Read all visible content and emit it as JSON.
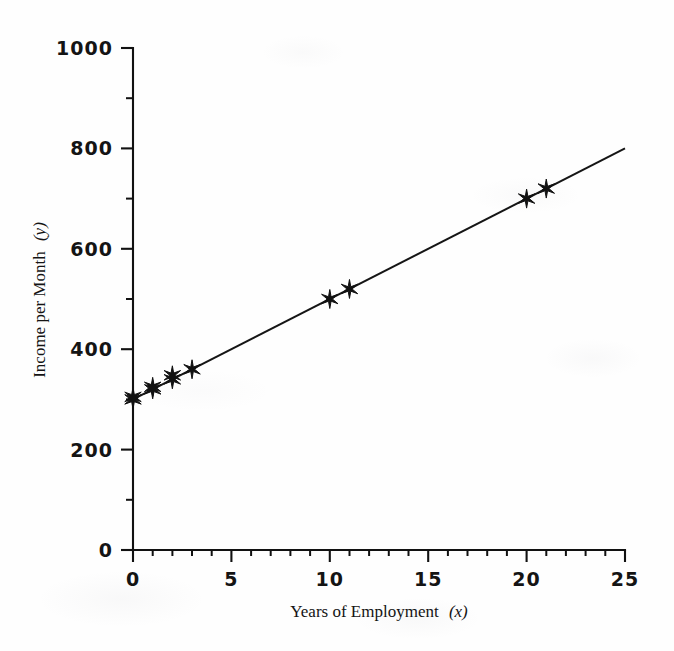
{
  "chart_data": {
    "type": "scatter",
    "title": "",
    "subtitle": "",
    "xlabel": "Years of Employment (x)",
    "xlabel_text": "Years of Employment",
    "xlabel_var": "(x)",
    "ylabel": "Income per Month (y)",
    "ylabel_text": "Income per Month",
    "ylabel_var": "(y)",
    "xlim": [
      0,
      25
    ],
    "ylim": [
      0,
      1000
    ],
    "x_ticks": [
      0,
      5,
      10,
      15,
      20,
      25
    ],
    "x_tick_labels": [
      "0",
      "5",
      "10",
      "15",
      "20",
      "25"
    ],
    "x_minor_ticks": [
      1,
      2,
      3,
      4,
      6,
      7,
      8,
      9,
      11,
      12,
      13,
      14,
      16,
      17,
      18,
      19,
      21,
      22,
      23,
      24
    ],
    "y_ticks": [
      0,
      200,
      400,
      600,
      800,
      1000
    ],
    "y_tick_labels": [
      "0",
      "200",
      "400",
      "600",
      "800",
      "1000"
    ],
    "y_minor_ticks": [
      100,
      300,
      500,
      700,
      900
    ],
    "grid": false,
    "legend": false,
    "legend_position": "none",
    "marker_style": "star",
    "marker_color": "#111111",
    "line_color": "#151515",
    "series": [
      {
        "name": "Observations",
        "type": "scatter",
        "points": [
          {
            "x": 0,
            "y": 300
          },
          {
            "x": 0,
            "y": 305
          },
          {
            "x": 1,
            "y": 320
          },
          {
            "x": 1,
            "y": 325
          },
          {
            "x": 2,
            "y": 340
          },
          {
            "x": 2,
            "y": 348
          },
          {
            "x": 3,
            "y": 360
          },
          {
            "x": 10,
            "y": 500
          },
          {
            "x": 11,
            "y": 520
          },
          {
            "x": 20,
            "y": 700
          },
          {
            "x": 21,
            "y": 720
          }
        ]
      },
      {
        "name": "Least squares regression line",
        "type": "line",
        "endpoints": [
          {
            "x": 0,
            "y": 300
          },
          {
            "x": 25,
            "y": 800
          }
        ],
        "slope": 20,
        "intercept": 300
      }
    ]
  },
  "figure": {
    "background_color": "#fefefe",
    "ink_color": "#111111",
    "axis_label_font": "sans-serif-bold",
    "axis_title_font": "serif"
  }
}
